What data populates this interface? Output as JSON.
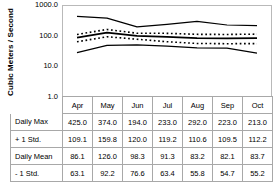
{
  "axis": {
    "y_title": "Cubic Meters / Second",
    "y_ticks": [
      "1000.0",
      "100.0",
      "10.0",
      "1.0"
    ]
  },
  "table": {
    "corner": "",
    "months": [
      "Apr",
      "May",
      "Jun",
      "Jul",
      "Aug",
      "Sep",
      "Oct"
    ],
    "rows": [
      {
        "label": "Daily Max",
        "values": [
          "425.0",
          "374.0",
          "194.0",
          "233.0",
          "292.0",
          "223.0",
          "213.0"
        ]
      },
      {
        "label": "+ 1 Std.",
        "values": [
          "109.1",
          "159.8",
          "120.0",
          "119.2",
          "110.6",
          "109.5",
          "112.2"
        ]
      },
      {
        "label": "Daily Mean",
        "values": [
          "86.1",
          "126.0",
          "98.3",
          "91.3",
          "83.2",
          "82.1",
          "83.7"
        ]
      },
      {
        "label": "- 1 Std.",
        "values": [
          "63.1",
          "92.2",
          "76.6",
          "63.4",
          "55.8",
          "54.7",
          "55.2"
        ]
      },
      {
        "label": "Daily Min.",
        "values": [
          "28.0",
          "48.1",
          "50.0",
          "45.3",
          "40.2",
          "39.1",
          "27.0"
        ]
      }
    ]
  },
  "chart_data": {
    "type": "line",
    "title": "",
    "xlabel": "",
    "ylabel": "Cubic Meters / Second",
    "yscale": "log",
    "ylim": [
      1.0,
      1000.0
    ],
    "ytick_values": [
      1000.0,
      100.0,
      10.0,
      1.0
    ],
    "grid": false,
    "legend": "none",
    "categories": [
      "Apr",
      "May",
      "Jun",
      "Jul",
      "Aug",
      "Sep",
      "Oct"
    ],
    "series": [
      {
        "name": "Daily Max",
        "style": "solid",
        "width": 1.2,
        "values": [
          425.0,
          374.0,
          194.0,
          233.0,
          292.0,
          223.0,
          213.0
        ]
      },
      {
        "name": "+ 1 Std.",
        "style": "dotted",
        "width": 1.6,
        "values": [
          109.1,
          159.8,
          120.0,
          119.2,
          110.6,
          109.5,
          112.2
        ]
      },
      {
        "name": "Daily Mean",
        "style": "solid",
        "width": 1.8,
        "values": [
          86.1,
          126.0,
          98.3,
          91.3,
          83.2,
          82.1,
          83.7
        ]
      },
      {
        "name": "- 1 Std.",
        "style": "dotted",
        "width": 1.6,
        "values": [
          63.1,
          92.2,
          76.6,
          63.4,
          55.8,
          54.7,
          55.2
        ]
      },
      {
        "name": "Daily Min.",
        "style": "solid",
        "width": 1.2,
        "values": [
          28.0,
          48.1,
          50.0,
          45.3,
          40.2,
          39.1,
          27.0
        ]
      }
    ]
  },
  "colors": {
    "line": "#000000",
    "frame": "#b9b9b9",
    "table_border": "#a8a8a8",
    "background": "#ffffff"
  }
}
